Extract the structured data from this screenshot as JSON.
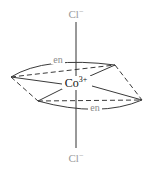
{
  "diagram": {
    "metal": {
      "symbol": "Co",
      "charge": "3+"
    },
    "axial_ligands": [
      {
        "position": "top",
        "symbol": "Cl",
        "charge": "−"
      },
      {
        "position": "bottom",
        "symbol": "Cl",
        "charge": "−"
      }
    ],
    "equatorial_ligands": [
      {
        "position": "back",
        "label": "en"
      },
      {
        "position": "front",
        "label": "en"
      }
    ],
    "colors": {
      "ligand_text": "#9a9a9a",
      "metal_text": "#111111",
      "lines": "#3a3a3a",
      "background": "#ffffff"
    }
  }
}
